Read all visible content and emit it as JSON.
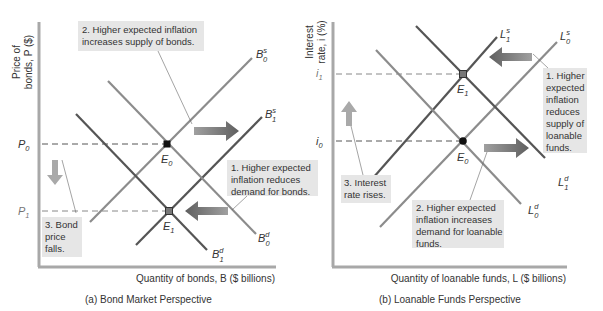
{
  "colors": {
    "axis": "#a8a8a8",
    "curve_dark": "#555555",
    "curve_light": "#8c8c8c",
    "annotation_box": "#e6e6e6",
    "arrow_dark": "#6e6e6e",
    "arrow_light": "#a9a9a9",
    "text": "#333333"
  },
  "panel_a": {
    "caption": "(a) Bond Market Perspective",
    "y_axis_title_line1": "Price of",
    "y_axis_title_line2": "bonds, P ($)",
    "x_axis_title": "Quantity of bonds, B ($ billions)",
    "tick_p0": "P",
    "tick_p0_sub": "0",
    "tick_p1": "P",
    "tick_p1_sub": "1",
    "curves": {
      "supply_0": {
        "base": "B",
        "sup": "s",
        "sub": "0"
      },
      "supply_1": {
        "base": "B",
        "sup": "s",
        "sub": "1"
      },
      "demand_0": {
        "base": "B",
        "sup": "d",
        "sub": "0"
      },
      "demand_1": {
        "base": "B",
        "sup": "d",
        "sub": "1"
      }
    },
    "equilibria": {
      "e0": {
        "base": "E",
        "sub": "0"
      },
      "e1": {
        "base": "E",
        "sub": "1"
      }
    },
    "annotations": {
      "step1": [
        "1. Higher expected",
        "inflation reduces",
        "demand for bonds."
      ],
      "step2": [
        "2. Higher expected inflation",
        "increases supply of bonds."
      ],
      "step3": [
        "3. Bond",
        "price",
        "falls."
      ]
    }
  },
  "panel_b": {
    "caption": "(b) Loanable Funds Perspective",
    "y_axis_title_line1": "Interest",
    "y_axis_title_line2": "rate, i (%)",
    "x_axis_title": "Quantity of loanable funds, L ($ billions)",
    "tick_i0": "i",
    "tick_i0_sub": "0",
    "tick_i1": "i",
    "tick_i1_sub": "1",
    "curves": {
      "supply_0": {
        "base": "L",
        "sup": "s",
        "sub": "0"
      },
      "supply_1": {
        "base": "L",
        "sup": "s",
        "sub": "1"
      },
      "demand_0": {
        "base": "L",
        "sup": "d",
        "sub": "0"
      },
      "demand_1": {
        "base": "L",
        "sup": "d",
        "sub": "1"
      }
    },
    "equilibria": {
      "e0": {
        "base": "E",
        "sub": "0"
      },
      "e1": {
        "base": "E",
        "sub": "1"
      }
    },
    "annotations": {
      "step1": [
        "1. Higher",
        "expected",
        "inflation",
        "reduces",
        "supply of",
        "loanable",
        "funds."
      ],
      "step2": [
        "2. Higher expected",
        "inflation increases",
        "demand for loanable",
        "funds."
      ],
      "step3": [
        "3. Interest",
        "rate rises."
      ]
    }
  }
}
